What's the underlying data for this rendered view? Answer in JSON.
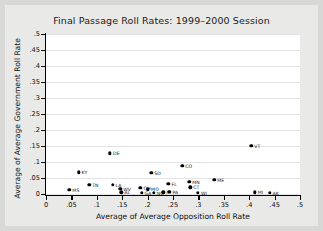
{
  "chart_data": {
    "type": "scatter",
    "title": "Final Passage Roll Rates: 1999–2000 Session",
    "xlabel": "Average of Average Opposition Roll Rate",
    "ylabel": "Average of Average Government Roll Rate",
    "xlim": [
      0,
      0.5
    ],
    "ylim": [
      0,
      0.5
    ],
    "xticks": [
      "0",
      ".05",
      ".1",
      ".15",
      ".2",
      ".25",
      ".3",
      ".35",
      ".4",
      ".45",
      ".5"
    ],
    "xtick_values": [
      0,
      0.05,
      0.1,
      0.15,
      0.2,
      0.25,
      0.3,
      0.35,
      0.4,
      0.45,
      0.5
    ],
    "yticks": [
      "0",
      ".05",
      ".1",
      ".15",
      ".2",
      ".25",
      ".3",
      ".35",
      ".4",
      ".45",
      ".5"
    ],
    "ytick_values": [
      0,
      0.05,
      0.1,
      0.15,
      0.2,
      0.25,
      0.3,
      0.35,
      0.4,
      0.45,
      0.5
    ],
    "grid": "horizontal",
    "legend": "none",
    "marker_color": "#000000",
    "plot_background": "#ffffff",
    "figure_background": "#e9e9e7",
    "points": [
      {
        "label": "MS",
        "x": 0.046,
        "y": 0.013
      },
      {
        "label": "KY",
        "x": 0.064,
        "y": 0.068
      },
      {
        "label": "TN",
        "x": 0.085,
        "y": 0.029
      },
      {
        "label": "DE",
        "x": 0.126,
        "y": 0.127
      },
      {
        "label": "LA",
        "x": 0.131,
        "y": 0.028
      },
      {
        "label": "WV",
        "x": 0.146,
        "y": 0.016
      },
      {
        "label": "AL",
        "x": 0.148,
        "y": 0.005
      },
      {
        "label": "OH",
        "x": 0.186,
        "y": 0.019
      },
      {
        "label": "GA",
        "x": 0.188,
        "y": 0.004
      },
      {
        "label": "MO",
        "x": 0.201,
        "y": 0.015
      },
      {
        "label": "SD",
        "x": 0.207,
        "y": 0.067
      },
      {
        "label": "NC",
        "x": 0.212,
        "y": 0.004
      },
      {
        "label": "IA",
        "x": 0.231,
        "y": 0.005
      },
      {
        "label": "FL",
        "x": 0.241,
        "y": 0.032
      },
      {
        "label": "PA",
        "x": 0.243,
        "y": 0.006
      },
      {
        "label": "CO",
        "x": 0.268,
        "y": 0.088
      },
      {
        "label": "MN",
        "x": 0.282,
        "y": 0.038
      },
      {
        "label": "CT",
        "x": 0.284,
        "y": 0.021
      },
      {
        "label": "WI",
        "x": 0.299,
        "y": 0.003
      },
      {
        "label": "ME",
        "x": 0.331,
        "y": 0.045
      },
      {
        "label": "VT",
        "x": 0.404,
        "y": 0.15
      },
      {
        "label": "MI",
        "x": 0.411,
        "y": 0.005
      },
      {
        "label": "AK",
        "x": 0.44,
        "y": 0.004
      }
    ]
  }
}
